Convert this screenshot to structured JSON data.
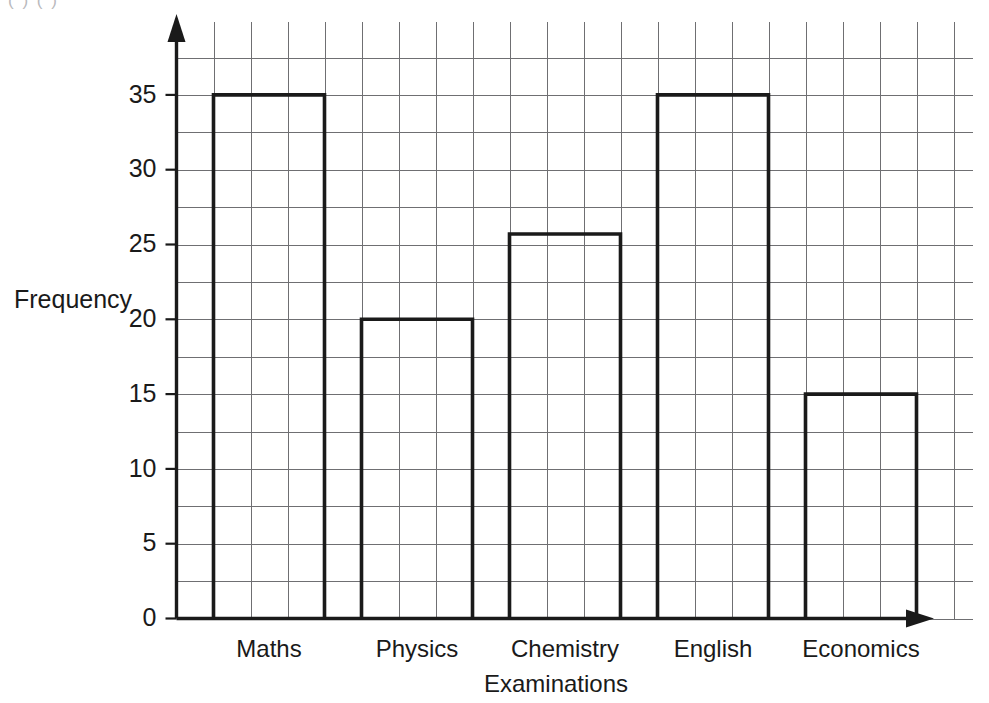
{
  "artifact": {
    "top_fragment": "( )      ( )"
  },
  "chart_data": {
    "type": "bar",
    "title": "",
    "subtitle": "",
    "xlabel": "Examinations",
    "ylabel": "Frequency",
    "categories": [
      "Maths",
      "Physics",
      "Chemistry",
      "English",
      "Economics"
    ],
    "values": [
      35,
      20,
      25.7,
      35,
      15
    ],
    "ylim": [
      0,
      40
    ],
    "xlim": [
      0,
      5
    ],
    "ytick_labels": [
      "0",
      "5",
      "10",
      "15",
      "20",
      "25",
      "30",
      "35"
    ],
    "ytick_values": [
      0,
      5,
      10,
      15,
      20,
      25,
      30,
      35
    ],
    "y_minor_step": 2.5,
    "grid": true,
    "grid_color": "#6f6f72",
    "legend": "none",
    "bar_fill": "#ffffff",
    "bar_stroke": "#1a1a1a",
    "axis_color": "#1a1a1a",
    "x_axis_has_arrow": true,
    "y_axis_has_arrow": true,
    "annotations": []
  }
}
